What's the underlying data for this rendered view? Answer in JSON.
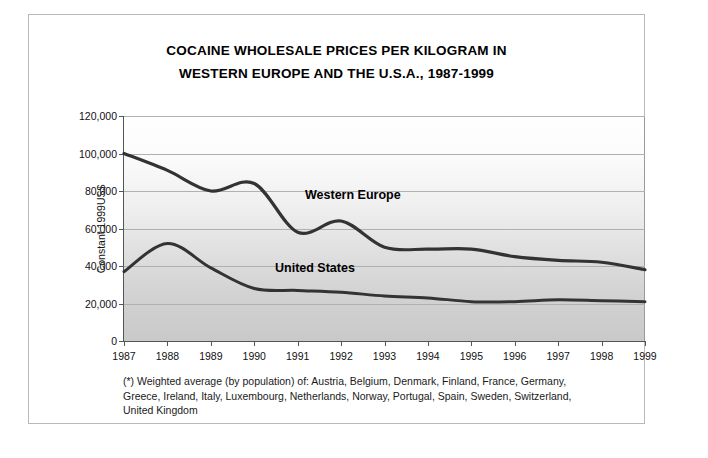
{
  "title": {
    "line1": "COCAINE WHOLESALE PRICES PER KILOGRAM IN",
    "line2": "WESTERN EUROPE AND THE U.S.A., 1987-1999"
  },
  "footnote": {
    "line1": "(*) Weighted average (by population) of: Austria, Belgium, Denmark, Finland, France, Germany,",
    "line2": "Greece, Ireland, Italy, Luxembourg, Netherlands, Norway, Portugal, Spain, Sweden, Switzerland,",
    "line3": "United Kingdom"
  },
  "annotations": {
    "western_europe_label": "Western Europe",
    "united_states_label": "United States"
  },
  "colors": {
    "line": "#333333",
    "grid": "#b0b0b0",
    "axis": "#555555",
    "plot_top": "#ffffff",
    "plot_bottom": "#c9c9c9",
    "frame": "#b9b9b9"
  },
  "chart_data": {
    "type": "line",
    "title": "COCAINE WHOLESALE PRICES PER KILOGRAM IN WESTERN EUROPE AND THE U.S.A., 1987-1999",
    "xlabel": "",
    "ylabel": "Constant 1999US$",
    "x": [
      1987,
      1988,
      1989,
      1990,
      1991,
      1992,
      1993,
      1994,
      1995,
      1996,
      1997,
      1998,
      1999
    ],
    "xtick_labels": [
      "1987",
      "1988",
      "1989",
      "1990",
      "1991",
      "1992",
      "1993",
      "1994",
      "1995",
      "1996",
      "1997",
      "1998",
      "1999"
    ],
    "ytick_labels": [
      "0",
      "20,000",
      "40,000",
      "60,000",
      "80,000",
      "100,000",
      "120,000"
    ],
    "yticks": [
      0,
      20000,
      40000,
      60000,
      80000,
      100000,
      120000
    ],
    "ylim": [
      0,
      120000
    ],
    "xlim": [
      1987,
      1999
    ],
    "grid": true,
    "legend": "inline-annotations",
    "series": [
      {
        "name": "Western Europe",
        "values": [
          100000,
          91000,
          80000,
          84000,
          58000,
          64000,
          50000,
          49000,
          49000,
          45000,
          43000,
          42000,
          38000
        ]
      },
      {
        "name": "United States",
        "values": [
          37000,
          52000,
          39000,
          28000,
          27000,
          26000,
          24000,
          23000,
          21000,
          21000,
          22000,
          21500,
          21000
        ]
      }
    ]
  }
}
